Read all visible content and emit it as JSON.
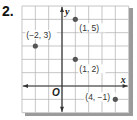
{
  "problem_number": "2.",
  "graph": {
    "axis_labels": {
      "x": "x",
      "y": "y",
      "origin": "O"
    },
    "x_range": [
      -3,
      5
    ],
    "y_range": [
      -2,
      6
    ],
    "grid_step": 1,
    "colors": {
      "grid": "#b8b8b8",
      "axis": "#333333",
      "point": "#555555",
      "shadow": "#888888"
    },
    "points": [
      {
        "x": -2,
        "y": 3,
        "label": "(−2, 3)"
      },
      {
        "x": 1,
        "y": 5,
        "label": "(1, 5)"
      },
      {
        "x": 1,
        "y": 2,
        "label": "(1, 2)"
      },
      {
        "x": 4,
        "y": -1,
        "label": "(4, −1)"
      }
    ]
  }
}
